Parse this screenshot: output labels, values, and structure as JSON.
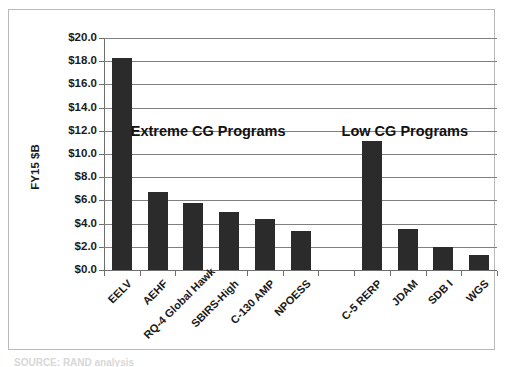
{
  "chart_data": {
    "type": "bar",
    "title": "",
    "xlabel": "",
    "ylabel": "FY15 $B",
    "ylim": [
      0,
      20
    ],
    "ytick_step": 2,
    "ytick_labels": [
      "$20.0",
      "$18.0",
      "$16.0",
      "$14.0",
      "$12.0",
      "$10.0",
      "$8.0",
      "$6.0",
      "$4.0",
      "$2.0",
      "$0.0"
    ],
    "ytick_values": [
      20,
      18,
      16,
      14,
      12,
      10,
      8,
      6,
      4,
      2,
      0
    ],
    "grid": true,
    "legend": "none",
    "bar_color": "#2b2b2b",
    "categories": [
      "EELV",
      "AEHF",
      "RQ-4 Global Hawk",
      "SBIRS-High",
      "C-130 AMP",
      "NPOESS",
      "",
      "C-5 RERP",
      "JDAM",
      "SDB I",
      "WGS"
    ],
    "values": [
      18.3,
      6.7,
      5.8,
      5.0,
      4.4,
      3.4,
      null,
      11.1,
      3.5,
      2.0,
      1.3
    ],
    "annotations": [
      {
        "text": "Extreme CG Programs",
        "group": "extreme"
      },
      {
        "text": "Low CG Programs",
        "group": "low"
      }
    ]
  },
  "caption": {
    "bottom_text": "SOURCE: RAND analysis"
  }
}
